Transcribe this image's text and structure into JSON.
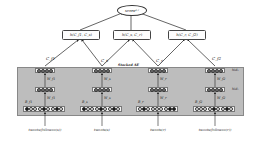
{
  "root": {
    "label": "score",
    "subscript": "s,r"
  },
  "h_nodes": [
    {
      "label": "h(C",
      "a": "f1",
      "b": "s",
      "text": "h(C_f1, C_s)"
    },
    {
      "label": "h(C",
      "a": "s",
      "b": "r",
      "text": "h(C_s, C_r)"
    },
    {
      "label": "h(C",
      "a": "r",
      "b": "f2",
      "text": "h(C_r, C_f2)"
    }
  ],
  "stacked_ae_label": "Stacked AE",
  "columns": [
    {
      "code": "C_f1",
      "hid2_label": "",
      "hid1_label": "",
      "weight2": "W_f1",
      "weight1": "W_f1",
      "input_label": "B_f1",
      "source": "tweets(followee(s))",
      "input_pattern": [
        1,
        0,
        0,
        0,
        1,
        0,
        0,
        1,
        0
      ]
    },
    {
      "code": "C_s",
      "hid2_label": "",
      "hid1_label": "",
      "weight2": "W_s",
      "weight1": "W_s",
      "input_label": "B_s",
      "source": "tweets(s)",
      "input_pattern": [
        1,
        0,
        0,
        0,
        1,
        0,
        0,
        1,
        0
      ]
    },
    {
      "code": "C_r",
      "hid2_label": "",
      "hid1_label": "",
      "weight2": "W_r",
      "weight1": "W_r",
      "input_label": "B_r",
      "source": "tweets(r)",
      "input_pattern": [
        0,
        1,
        0,
        0,
        0,
        0,
        0,
        1,
        1
      ]
    },
    {
      "code": "C_f2",
      "hid2_label": "hid2",
      "hid1_label": "hid1",
      "weight2": "W_f2",
      "weight1": "W_f2",
      "input_label": "B_f2",
      "source": "tweets(followee(r))",
      "input_pattern": [
        0,
        0,
        0,
        0,
        1,
        0,
        0,
        1,
        0
      ]
    }
  ],
  "layer_names": {
    "hid2": "hid₂",
    "hid1": "hid₁"
  },
  "colors": {
    "stack_bg": "#bdbdbd",
    "node_fill": "#7a7a7a",
    "active_input": "#111111",
    "line": "#222222"
  }
}
